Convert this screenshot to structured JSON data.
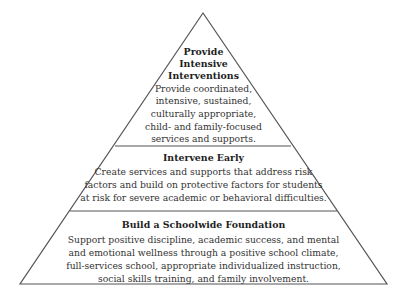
{
  "diagram": {
    "type": "pyramid",
    "tiers": [
      {
        "level": "top",
        "heading_lines": [
          "Provide",
          "Intensive",
          "Interventions"
        ],
        "body_lines": [
          "Provide coordinated,",
          "intensive, sustained,",
          "culturally appropriate,",
          "child- and family-focused",
          "services and supports."
        ]
      },
      {
        "level": "middle",
        "heading_lines": [
          "Intervene Early"
        ],
        "body_lines": [
          "Create services and supports that address risk",
          "factors and build on protective factors for students",
          "at risk for severe academic or behavioral difficulties."
        ]
      },
      {
        "level": "bottom",
        "heading_lines": [
          "Build a Schoolwide Foundation"
        ],
        "body_lines": [
          "Support positive discipline, academic success, and mental",
          "and emotional wellness through a positive school climate,",
          "full-services school, appropriate individualized instruction,",
          "social skills training, and family involvement."
        ]
      }
    ],
    "colors": {
      "stroke": "#555555",
      "background": "#ffffff",
      "text": "#333333"
    }
  }
}
